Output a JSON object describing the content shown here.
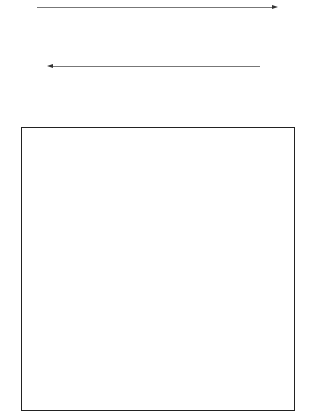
{
  "figure": {
    "tones": {
      "L": "#f2f2f2",
      "l": "#d9d9d9",
      "m": "#b3b3b3",
      "d": "#8c8c8c",
      "D": "#6e6e6e"
    },
    "top_strip": {
      "arrow_direction": "right",
      "blocks": [
        [
          "lLLl",
          "mmdd",
          "LlLl",
          "L"
        ],
        [
          "dDmd",
          "LlLl",
          "mdmd",
          "l"
        ],
        [
          "lLLl",
          "mddm",
          "LLll",
          "l"
        ],
        [
          "dmDd",
          "lLLl",
          "mdmm",
          "L"
        ],
        [
          "LlLl",
          "dmdm",
          "lLlL",
          "L"
        ],
        [
          "dDmd",
          "lLLl",
          "mddm",
          "L"
        ],
        [
          "LLll",
          "dmmd",
          "lLlL",
          "l"
        ]
      ]
    },
    "middle_strip": {
      "arrow_direction": "left",
      "blocks": [
        [
          "dmmD",
          "LlLl",
          "mdmd",
          "l"
        ],
        [
          "LlLl",
          "mdmd",
          "lLlL",
          "L"
        ],
        [
          "dmmd",
          "LlLL",
          "dmdm",
          "l"
        ],
        [
          "lLlL",
          "mddm",
          "LlLl",
          "L"
        ],
        [
          "dmDd",
          "LLlL",
          "mdmm",
          "l"
        ],
        [
          "LlLl",
          "dmmd",
          "lLLl",
          "L"
        ],
        [
          "mdDm",
          "lLlL",
          "dmdm",
          "L"
        ]
      ]
    },
    "quilt_grid": {
      "rows": 7,
      "cols": 7,
      "blocks": [
        [
          "lLLl",
          "mddm",
          "LlLl",
          "L"
        ],
        [
          "dmDd",
          "LlLl",
          "mdmd",
          "l"
        ],
        [
          "LlLl",
          "mdmd",
          "lLlL",
          "L"
        ],
        [
          "dmmd",
          "lLLl",
          "dmdm",
          "l"
        ],
        [
          "lLlL",
          "dmmd",
          "LlLl",
          "L"
        ],
        [
          "dmDd",
          "LlLl",
          "mddm",
          "l"
        ],
        [
          "LlLl",
          "mdmd",
          "lLLl",
          "L"
        ],
        [
          "dmmd",
          "LlLl",
          "mdmd",
          "l"
        ],
        [
          "lLLl",
          "dmdm",
          "LlLl",
          "L"
        ],
        [
          "dmDd",
          "lLlL",
          "mddm",
          "l"
        ],
        [
          "LlLl",
          "mdmd",
          "lLLl",
          "L"
        ],
        [
          "dmmd",
          "LlLl",
          "dmdm",
          "l"
        ],
        [
          "lLlL",
          "mddm",
          "LlLl",
          "L"
        ],
        [
          "dmDd",
          "lLLl",
          "mdmd",
          "l"
        ],
        [
          "LlLl",
          "mddm",
          "lLlL",
          "L"
        ],
        [
          "dmmd",
          "LlLl",
          "mdmd",
          "l"
        ],
        [
          "lLLl",
          "dmdm",
          "LlLl",
          "L"
        ],
        [
          "dmDd",
          "LlLl",
          "mdmd",
          "l"
        ],
        [
          "LlLl",
          "mdmm",
          "lLLl",
          "L"
        ],
        [
          "dmmd",
          "lLlL",
          "mddm",
          "l"
        ],
        [
          "lLLl",
          "mdmd",
          "LlLl",
          "L"
        ],
        [
          "dmDd",
          "LlLl",
          "mdmd",
          "l"
        ],
        [
          "LlLl",
          "dmmd",
          "lLLl",
          "L"
        ],
        [
          "dmmd",
          "LLlL",
          "mdmd",
          "l"
        ],
        [
          "lLlL",
          "mddm",
          "LlLl",
          "L"
        ],
        [
          "dmDd",
          "lLLl",
          "dmdm",
          "l"
        ],
        [
          "LlLl",
          "mdmd",
          "lLlL",
          "L"
        ],
        [
          "dmmd",
          "LlLl",
          "mddm",
          "l"
        ],
        [
          "lLLl",
          "dmdm",
          "LlLl",
          "L"
        ],
        [
          "dmDd",
          "lLlL",
          "mdmd",
          "l"
        ],
        [
          "LlLl",
          "mddm",
          "lLLl",
          "L"
        ],
        [
          "dmmd",
          "LlLl",
          "dmdm",
          "l"
        ],
        [
          "lLlL",
          "mdmd",
          "LlLl",
          "L"
        ],
        [
          "dmDd",
          "LlLl",
          "mdmm",
          "l"
        ],
        [
          "LlLl",
          "dmmd",
          "lLlL",
          "L"
        ],
        [
          "dmmd",
          "lLLl",
          "mdmd",
          "l"
        ],
        [
          "lLlL",
          "mddm",
          "LlLl",
          "L"
        ],
        [
          "dmDd",
          "LlLl",
          "dmdm",
          "l"
        ],
        [
          "LlLl",
          "mdmd",
          "lLLl",
          "L"
        ],
        [
          "dmmd",
          "LlLl",
          "mddm",
          "l"
        ],
        [
          "lLLl",
          "dmdm",
          "LlLl",
          "L"
        ],
        [
          "dmDd",
          "lLlL",
          "mdmd",
          "l"
        ],
        [
          "lLLl",
          "mdmd",
          "LlLl",
          "L"
        ],
        [
          "dmmd",
          "LlLl",
          "mddm",
          "l"
        ],
        [
          "lLlL",
          "dmdm",
          "LlLl",
          "L"
        ],
        [
          "dmDd",
          "lLLl",
          "mdmd",
          "l"
        ],
        [
          "LlLl",
          "mddm",
          "lLlL",
          "L"
        ],
        [
          "dmmd",
          "LlLl",
          "dmdm",
          "l"
        ],
        [
          "lLLl",
          "mdmd",
          "LlLl",
          "L"
        ]
      ]
    }
  }
}
